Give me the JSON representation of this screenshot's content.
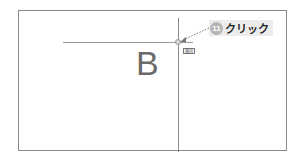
{
  "canvas": {
    "label_letter": "B",
    "tooltip_text": "端点"
  },
  "callout": {
    "step_number": "11",
    "action_text": "クリック"
  },
  "colors": {
    "line": "#8a8a8a",
    "callout_bg": "#ececec",
    "badge": "#b5b5b5"
  }
}
